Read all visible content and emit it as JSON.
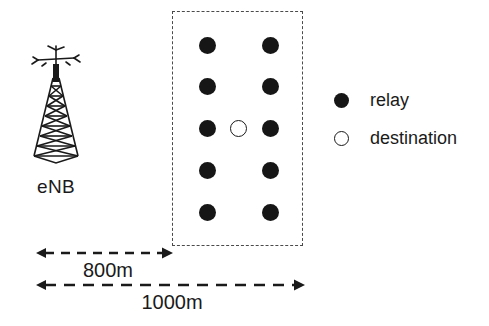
{
  "diagram": {
    "enb": {
      "label": "eNB",
      "icon": "cell-tower-icon"
    },
    "region": {
      "name": "relay-deployment-region",
      "border_style": "dashed",
      "border_color": "#4a4a4a"
    },
    "nodes": {
      "relay_color": "#161616",
      "destination_fill": "#ffffff",
      "destination_stroke": "#1a1a1a",
      "relay_count": 10,
      "destination_count": 1,
      "rows": 5,
      "columns": 2,
      "relay_positions": [
        {
          "x": 207,
          "y": 45
        },
        {
          "x": 270,
          "y": 45
        },
        {
          "x": 207,
          "y": 86
        },
        {
          "x": 270,
          "y": 86
        },
        {
          "x": 207,
          "y": 128
        },
        {
          "x": 270,
          "y": 128
        },
        {
          "x": 207,
          "y": 170
        },
        {
          "x": 270,
          "y": 170
        },
        {
          "x": 207,
          "y": 212
        },
        {
          "x": 270,
          "y": 212
        }
      ],
      "destination_position": {
        "x": 238,
        "y": 128
      }
    },
    "legend": {
      "items": [
        {
          "label": "relay",
          "marker": "filled-circle"
        },
        {
          "label": "destination",
          "marker": "hollow-circle"
        }
      ]
    },
    "dimensions": [
      {
        "label": "800m",
        "name": "dimension-800m"
      },
      {
        "label": "1000m",
        "name": "dimension-1000m"
      }
    ]
  }
}
